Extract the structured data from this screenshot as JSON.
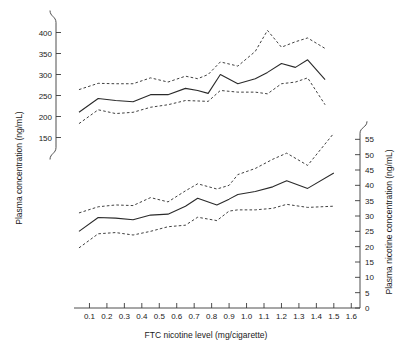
{
  "figure": {
    "background_color": "#ffffff",
    "line_color": "#2a2a2a",
    "axis_color": "#3a3a3a"
  },
  "chart_data": {
    "type": "line",
    "title": "",
    "subtitle": "",
    "xlabel": "FTC nicotine level (mg/cigarette)",
    "ylabel_left": "Plasma concentration (ng/mL)",
    "ylabel_right": "Plasma nicotine concentration (ng/mL)",
    "xlim": [
      0.0,
      1.65
    ],
    "xticks": [
      0.1,
      0.2,
      0.3,
      0.4,
      0.5,
      0.6,
      0.7,
      0.8,
      0.9,
      1.0,
      1.1,
      1.2,
      1.3,
      1.4,
      1.5,
      1.6
    ],
    "xticklabels": [
      "0.1",
      "0.2",
      "0.3",
      "0.4",
      "0.5",
      "0.6",
      "0.7",
      "0.8",
      "0.9",
      "1.0",
      "1.1",
      "1.2",
      "1.3",
      "1.4",
      "1.5",
      "1.6"
    ],
    "ylim_left": [
      125,
      425
    ],
    "yticks_left": [
      150,
      200,
      250,
      300,
      350,
      400
    ],
    "yticklabels_left": [
      "150",
      "200",
      "250",
      "300",
      "350",
      "400"
    ],
    "ylim_right": [
      0,
      60
    ],
    "yticks_right": [
      0,
      5,
      10,
      15,
      20,
      25,
      30,
      35,
      40,
      45,
      50,
      55
    ],
    "yticklabels_right": [
      "0",
      "5",
      "10",
      "15",
      "20",
      "25",
      "30",
      "35",
      "40",
      "45",
      "50",
      "55"
    ],
    "left_axis_break": true,
    "right_axis_break": true,
    "grid": false,
    "legend": "none",
    "series": [
      {
        "name": "Plasma concentration (upper curve, left axis)",
        "axis": "left",
        "style": "solid",
        "x": [
          0.04,
          0.15,
          0.25,
          0.35,
          0.45,
          0.55,
          0.65,
          0.72,
          0.78,
          0.85,
          0.95,
          1.05,
          1.12,
          1.2,
          1.28,
          1.35,
          1.45
        ],
        "values": [
          210,
          243,
          238,
          235,
          252,
          252,
          267,
          262,
          255,
          300,
          278,
          290,
          305,
          326,
          317,
          335,
          288
        ]
      },
      {
        "name": "Plasma concentration upper confidence limit",
        "axis": "left",
        "style": "dashed",
        "x": [
          0.04,
          0.15,
          0.25,
          0.35,
          0.45,
          0.55,
          0.65,
          0.72,
          0.78,
          0.85,
          0.95,
          1.05,
          1.12,
          1.2,
          1.28,
          1.35,
          1.45
        ],
        "values": [
          264,
          279,
          278,
          278,
          292,
          282,
          296,
          290,
          300,
          330,
          320,
          355,
          405,
          365,
          378,
          387,
          362
        ]
      },
      {
        "name": "Plasma concentration lower confidence limit",
        "axis": "left",
        "style": "dashed",
        "x": [
          0.04,
          0.15,
          0.25,
          0.35,
          0.45,
          0.55,
          0.65,
          0.72,
          0.78,
          0.85,
          0.95,
          1.05,
          1.12,
          1.2,
          1.28,
          1.35,
          1.45
        ],
        "values": [
          183,
          216,
          207,
          210,
          222,
          228,
          238,
          237,
          236,
          262,
          258,
          258,
          254,
          278,
          282,
          292,
          228
        ]
      },
      {
        "name": "Plasma nicotine concentration (lower curve, right axis)",
        "axis": "right",
        "style": "solid",
        "x": [
          0.04,
          0.15,
          0.25,
          0.35,
          0.45,
          0.55,
          0.65,
          0.72,
          0.83,
          0.9,
          0.95,
          1.05,
          1.15,
          1.23,
          1.35,
          1.5
        ],
        "values": [
          25.0,
          29.5,
          29.3,
          28.8,
          30.3,
          30.6,
          33.2,
          35.8,
          33.6,
          35.5,
          37.0,
          38.0,
          39.5,
          41.5,
          39.0,
          44.0
        ]
      },
      {
        "name": "Plasma nicotine upper confidence limit",
        "axis": "right",
        "style": "dashed",
        "x": [
          0.04,
          0.15,
          0.25,
          0.35,
          0.45,
          0.55,
          0.65,
          0.72,
          0.83,
          0.9,
          0.95,
          1.05,
          1.15,
          1.23,
          1.35,
          1.5
        ],
        "values": [
          31.0,
          33.0,
          33.6,
          33.4,
          36.0,
          34.6,
          38.2,
          40.5,
          38.8,
          40.0,
          43.5,
          45.5,
          48.5,
          50.5,
          46.5,
          57.0
        ]
      },
      {
        "name": "Plasma nicotine lower confidence limit",
        "axis": "right",
        "style": "dashed",
        "x": [
          0.04,
          0.15,
          0.25,
          0.35,
          0.45,
          0.55,
          0.65,
          0.72,
          0.83,
          0.9,
          0.95,
          1.05,
          1.15,
          1.23,
          1.35,
          1.5
        ],
        "values": [
          19.6,
          24.2,
          24.6,
          23.8,
          25.0,
          26.5,
          27.0,
          29.6,
          28.5,
          31.6,
          32.0,
          32.0,
          32.5,
          33.8,
          32.8,
          33.2
        ]
      }
    ]
  }
}
